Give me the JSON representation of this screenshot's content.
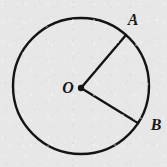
{
  "figure": {
    "kind": "geometry-diagram",
    "background_color": "#e7e7e7",
    "stroke_color": "#141414",
    "label_color": "#171717",
    "width": 167,
    "height": 167
  },
  "labels": {
    "center": "O",
    "point_a": "A",
    "point_b": "B"
  },
  "geometry": {
    "circle": {
      "center_x": 81,
      "center_y": 86,
      "radius": 68,
      "stroke_width": 2.4
    },
    "center_dot": {
      "x": 81,
      "y": 88,
      "radius": 3.2
    },
    "radius_oa": {
      "x1": 81,
      "y1": 88,
      "x2": 126,
      "y2": 35,
      "stroke_width": 2.4
    },
    "radius_ob": {
      "x1": 81,
      "y1": 88,
      "x2": 138,
      "y2": 123,
      "stroke_width": 2.4
    },
    "label_positions": {
      "center": {
        "x": 68,
        "y": 93,
        "font_size": 16
      },
      "point_a": {
        "x": 133,
        "y": 25,
        "font_size": 16
      },
      "point_b": {
        "x": 156,
        "y": 130,
        "font_size": 16
      }
    }
  }
}
